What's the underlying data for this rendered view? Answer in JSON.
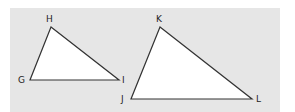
{
  "figure": {
    "background_color": "#e6e6e6",
    "triangles": [
      {
        "name": "GHI",
        "vertices": [
          {
            "label": "H",
            "x": 51,
            "y": 27
          },
          {
            "label": "G",
            "x": 30,
            "y": 80
          },
          {
            "label": "I",
            "x": 119,
            "y": 80
          }
        ]
      },
      {
        "name": "JKL",
        "vertices": [
          {
            "label": "K",
            "x": 160,
            "y": 27
          },
          {
            "label": "J",
            "x": 131,
            "y": 99
          },
          {
            "label": "L",
            "x": 252,
            "y": 99
          }
        ]
      }
    ],
    "labels": {
      "H": "H",
      "G": "G",
      "I": "I",
      "K": "K",
      "J": "J",
      "L": "L"
    }
  }
}
